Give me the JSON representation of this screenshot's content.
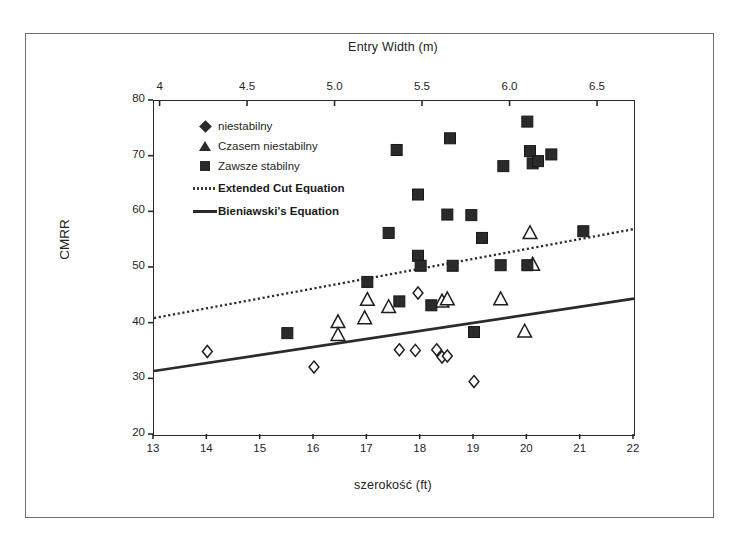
{
  "figure": {
    "top_axis_title": "Entry Width (m)",
    "bottom_axis_title": "szerokość    (ft)",
    "y_axis_title": "CMRR"
  },
  "legend": {
    "items": [
      {
        "label": "niestabilny",
        "symbol": "diamond-marker",
        "bold": false
      },
      {
        "label": "Czasem niestabilny",
        "symbol": "triangle-marker",
        "bold": false
      },
      {
        "label": "Zawsze stabilny",
        "symbol": "square-marker",
        "bold": false
      },
      {
        "label": "Extended Cut Equation",
        "symbol": "dotted-line",
        "bold": true
      },
      {
        "label": "Bieniawski's Equation",
        "symbol": "solid-line",
        "bold": true
      }
    ]
  },
  "chart_data": {
    "type": "scatter",
    "title": "",
    "xlabel": "szerokość    (ft)",
    "ylabel": "CMRR",
    "x2label": "Entry Width (m)",
    "xlim": [
      13,
      22
    ],
    "ylim": [
      20,
      80
    ],
    "x2lim": [
      3.9624,
      6.7056
    ],
    "grid": false,
    "legend_position": "upper-left-inside",
    "xticks": [
      13,
      14,
      15,
      16,
      17,
      18,
      19,
      20,
      21,
      22
    ],
    "xticklabels": [
      "13",
      "14",
      "15",
      "16",
      "17",
      "18",
      "19",
      "20",
      "21",
      "22"
    ],
    "yticks": [
      20,
      30,
      40,
      50,
      60,
      70,
      80
    ],
    "yticklabels": [
      "20",
      "30",
      "40",
      "50",
      "60",
      "70",
      "80"
    ],
    "x2ticks": [
      4,
      4.5,
      5.0,
      5.5,
      6.0,
      6.5
    ],
    "x2ticklabels": [
      "4",
      "4.5",
      "5.0",
      "5.5",
      "6.0",
      "6.5"
    ],
    "series": [
      {
        "name": "niestabilny",
        "marker": "diamond",
        "fill": "open",
        "points": [
          [
            14.0,
            35.0
          ],
          [
            16.0,
            32.2
          ],
          [
            17.6,
            35.3
          ],
          [
            17.9,
            35.2
          ],
          [
            18.3,
            35.3
          ],
          [
            18.4,
            34.0
          ],
          [
            18.5,
            34.2
          ],
          [
            19.0,
            29.6
          ],
          [
            17.95,
            45.5
          ]
        ]
      },
      {
        "name": "Czasem niestabilny",
        "marker": "triangle",
        "fill": "open",
        "points": [
          [
            16.45,
            40.3
          ],
          [
            16.45,
            38.0
          ],
          [
            16.95,
            41.0
          ],
          [
            17.0,
            44.3
          ],
          [
            17.4,
            43.0
          ],
          [
            18.4,
            44.0
          ],
          [
            18.5,
            44.4
          ],
          [
            19.5,
            44.4
          ],
          [
            19.95,
            38.6
          ],
          [
            20.05,
            56.3
          ],
          [
            20.1,
            50.6
          ]
        ]
      },
      {
        "name": "Zawsze stabilny",
        "marker": "square",
        "fill": "filled",
        "points": [
          [
            15.5,
            38.3
          ],
          [
            17.0,
            47.5
          ],
          [
            17.4,
            56.3
          ],
          [
            17.6,
            44.0
          ],
          [
            17.95,
            63.2
          ],
          [
            17.95,
            52.2
          ],
          [
            18.0,
            50.4
          ],
          [
            17.55,
            71.2
          ],
          [
            18.2,
            43.3
          ],
          [
            18.5,
            59.6
          ],
          [
            18.55,
            73.3
          ],
          [
            18.95,
            59.5
          ],
          [
            18.6,
            50.4
          ],
          [
            19.0,
            38.5
          ],
          [
            19.15,
            55.4
          ],
          [
            19.5,
            50.5
          ],
          [
            19.55,
            68.3
          ],
          [
            20.0,
            50.5
          ],
          [
            20.0,
            76.3
          ],
          [
            20.05,
            71.0
          ],
          [
            20.1,
            68.8
          ],
          [
            20.2,
            69.2
          ],
          [
            20.45,
            70.4
          ],
          [
            21.05,
            56.6
          ]
        ]
      }
    ],
    "lines": [
      {
        "name": "Extended Cut Equation",
        "style": "dotted",
        "x": [
          13,
          22
        ],
        "y": [
          41.0,
          57.0
        ]
      },
      {
        "name": "Bieniawski's Equation",
        "style": "solid",
        "x": [
          13,
          22
        ],
        "y": [
          31.5,
          44.5
        ]
      }
    ]
  }
}
